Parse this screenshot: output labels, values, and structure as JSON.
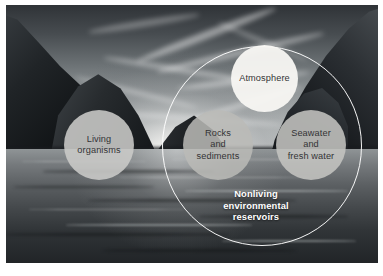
{
  "figure": {
    "name": "biogeochemical-reservoirs-diagram",
    "photo_description": "coastal cliffs and water at sunrise",
    "big_circle_label": "Nonliving environmental reservoirs",
    "caption": {
      "line1": "Nonliving",
      "line2": "environmental",
      "line3": "reservoirs"
    },
    "nodes": [
      {
        "id": "living-organisms",
        "lines": [
          "Living",
          "organisms"
        ],
        "inside_big_circle": false,
        "fill": "#cbcbc8"
      },
      {
        "id": "atmosphere",
        "lines": [
          "Atmosphere"
        ],
        "inside_big_circle": true,
        "fill": "#f8f7f3"
      },
      {
        "id": "rocks-and-sediments",
        "lines": [
          "Rocks",
          "and",
          "sediments"
        ],
        "inside_big_circle": true,
        "fill": "#babab7"
      },
      {
        "id": "seawater-and-fresh-water",
        "lines": [
          "Seawater",
          "and",
          "fresh water"
        ],
        "inside_big_circle": true,
        "fill": "#c4c4c1"
      }
    ],
    "colors": {
      "circle_outline": "#ffffff",
      "node_text": "#333335",
      "caption_text": "#ffffff",
      "background": "#ffffff"
    }
  }
}
